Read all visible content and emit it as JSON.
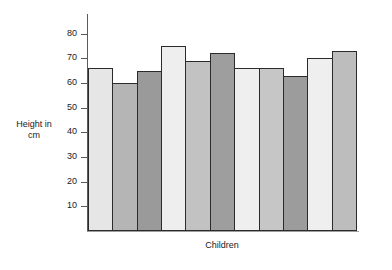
{
  "chart_data": {
    "type": "bar",
    "title": "",
    "subtitle": "",
    "xlabel": "Children",
    "ylabel": "Height in\ncm",
    "ylabel_lines": [
      "Height in",
      "cm"
    ],
    "categories": [
      "1",
      "2",
      "3",
      "4",
      "5",
      "6",
      "7",
      "8",
      "9",
      "10",
      "11"
    ],
    "values": [
      66,
      60,
      65,
      75,
      69,
      72,
      66,
      66,
      63,
      70,
      73
    ],
    "bar_colors": [
      "#e6e6e6",
      "#b5b5b5",
      "#9a9a9a",
      "#eeeeee",
      "#c2c2c2",
      "#9e9e9e",
      "#efefef",
      "#c6c6c6",
      "#9c9c9c",
      "#efefef",
      "#bdbdbd"
    ],
    "bar_outline_color": "#2b2b2b",
    "ylim": [
      0,
      88
    ],
    "ytick_values": [
      10,
      20,
      30,
      40,
      50,
      60,
      70,
      80
    ],
    "ytick_labels": [
      "10",
      "20",
      "30",
      "40",
      "50",
      "60",
      "70",
      "80"
    ],
    "xtick_labels": [],
    "grid": false,
    "legend": null,
    "bar_gap": 0,
    "axis_color": "#5a5a5a",
    "baseline_color": "#9e9e9e",
    "text_color": "#1a1a1a",
    "background": "#ffffff"
  }
}
